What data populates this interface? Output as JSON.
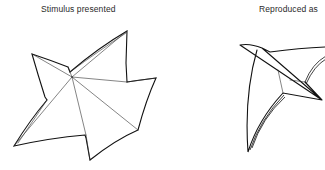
{
  "figure": {
    "panels": [
      {
        "id": "stimulus",
        "label": "Stimulus presented",
        "shape": "five-pointed irregular star with folded facets"
      },
      {
        "id": "reproduction",
        "label": "Reproduced as",
        "shape": "partial curved star drawing (cropped at right edge)"
      }
    ],
    "colors": {
      "line": "#111111",
      "background": "#ffffff",
      "text": "#2a2a2a"
    }
  }
}
